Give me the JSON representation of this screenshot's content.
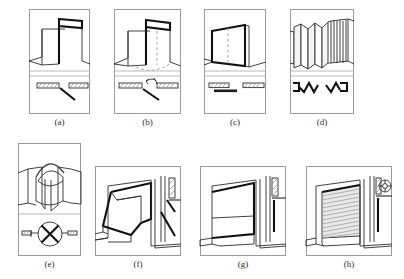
{
  "figure": {
    "panel_count": 8,
    "line_color": "#2b2b2b",
    "frame_color": "#9a9a9a",
    "hatch_color": "#333333",
    "shutter_fill": "#e9e9e9"
  },
  "panels": [
    {
      "caption": "(a)",
      "name": "single-swing-door",
      "door_type": "Single swing door",
      "views": "perspective over plan",
      "plan_symbol": "two hatched wall jambs with one straight leaf line swinging outward",
      "has_dashed_arc": false
    },
    {
      "caption": "(b)",
      "name": "double-acting-swing-door",
      "door_type": "Double-acting swing door",
      "views": "perspective over plan",
      "plan_symbol": "hatched jambs, leaf line and curved double arrow showing swing both ways",
      "has_dashed_arc": true
    },
    {
      "caption": "(c)",
      "name": "sliding-door",
      "door_type": "Sliding door",
      "views": "perspective over plan",
      "plan_symbol": "hatched jambs with leaf offset parallel to wall",
      "has_dashed_arc": false
    },
    {
      "caption": "(d)",
      "name": "folding-accordion-door",
      "door_type": "Folding (accordion) door",
      "views": "perspective over plan",
      "plan_symbol": "zigzag W symbols at both jambs",
      "has_dashed_arc": false
    },
    {
      "caption": "(e)",
      "name": "revolving-door",
      "door_type": "Revolving door",
      "views": "perspective over plan",
      "plan_symbol": "circle with crossed X leaves between two hatched wall stubs",
      "has_dashed_arc": false
    },
    {
      "caption": "(f)",
      "name": "awning-tilt-up-door",
      "door_type": "Awning / tilt-up door",
      "views": "perspective with side section",
      "plan_symbol": "section showing hatched lintel and inclined leaf with hinge",
      "has_dashed_arc": false
    },
    {
      "caption": "(g)",
      "name": "overhead-lifting-door",
      "door_type": "Overhead lifting door",
      "views": "perspective with side section",
      "plan_symbol": "section showing vertical track and hatched lintel",
      "has_dashed_arc": false
    },
    {
      "caption": "(h)",
      "name": "rolling-shutter-door",
      "door_type": "Rolling shutter door",
      "views": "perspective with side section",
      "plan_symbol": "section with roll drum circle at head and vertical guide rail",
      "has_dashed_arc": false
    }
  ]
}
